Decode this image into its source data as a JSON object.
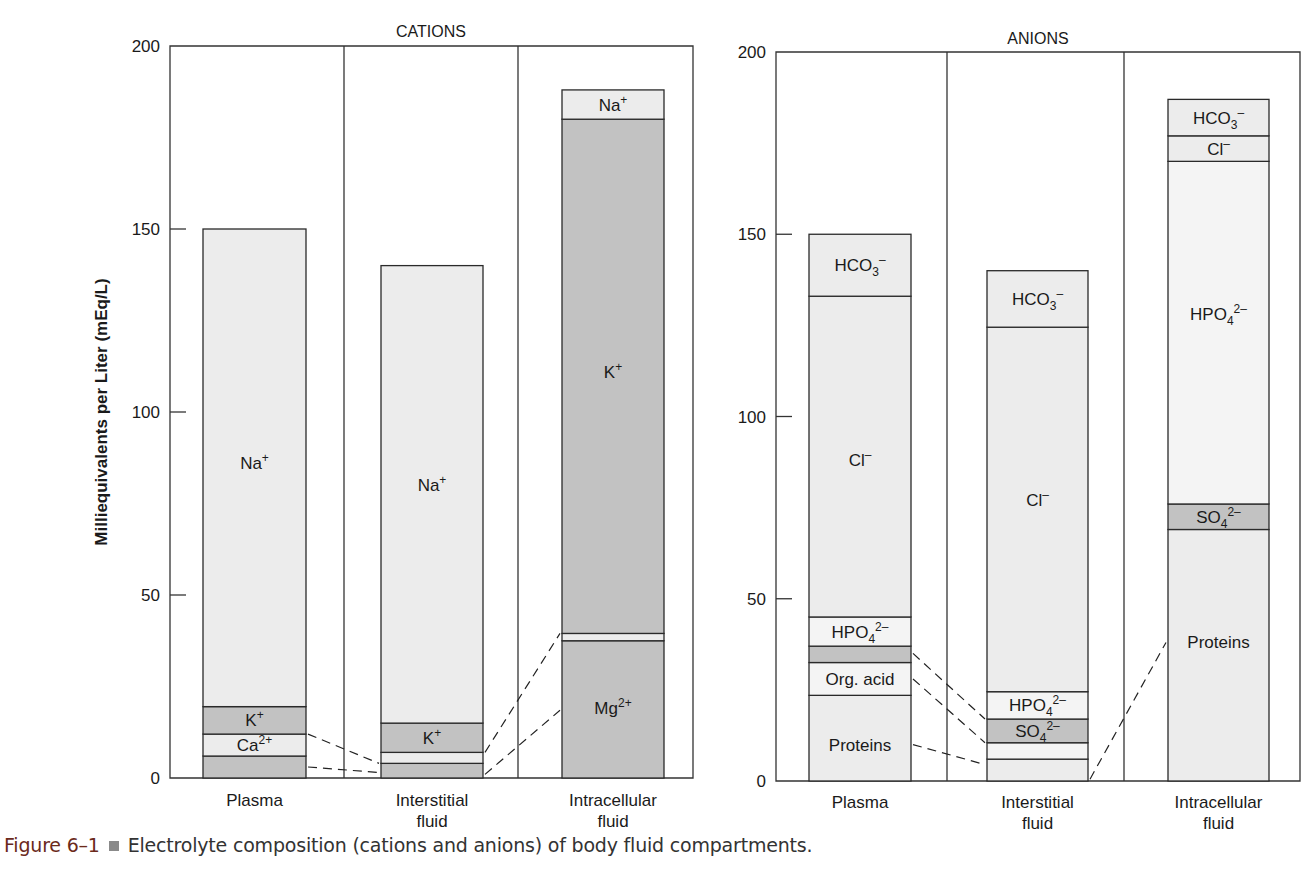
{
  "figure": {
    "caption_number": "Figure 6–1",
    "caption_text": "Electrolyte composition (cations and anions) of body fluid compartments.",
    "caption_number_color": "#6b2a1c"
  },
  "colors": {
    "light": "#ececec",
    "medium": "#d3d3d3",
    "dark": "#c2c2c2",
    "pale": "#f4f4f4",
    "frame": "#333333"
  },
  "chart_data": [
    {
      "type": "bar",
      "stacked": true,
      "title": "CATIONS",
      "xlabel": "",
      "ylabel": "Milliequivalents per Liter (mEq/L)",
      "ylim": [
        0,
        200
      ],
      "yticks": [
        0,
        50,
        100,
        150,
        200
      ],
      "categories": [
        "Plasma",
        "Interstitial fluid",
        "Intracellular fluid"
      ],
      "category_labels": [
        [
          "Plasma"
        ],
        [
          "Interstitial",
          "fluid"
        ],
        [
          "Intracellular",
          "fluid"
        ]
      ],
      "series": [
        {
          "name": "Mg2+",
          "values": [
            6,
            4,
            37.5
          ]
        },
        {
          "name": "Ca2+",
          "values": [
            6,
            3,
            2
          ]
        },
        {
          "name": "K+",
          "values": [
            7.5,
            8,
            140.5
          ]
        },
        {
          "name": "Na+",
          "values": [
            130.5,
            125,
            8
          ]
        }
      ],
      "totals": [
        150,
        140,
        188
      ],
      "stacks": [
        [
          {
            "from": 0,
            "to": 6,
            "shade": "dark",
            "label": ""
          },
          {
            "from": 6,
            "to": 12,
            "shade": "light",
            "label": "Ca",
            "sup": "2+"
          },
          {
            "from": 12,
            "to": 19.5,
            "shade": "dark",
            "label": "K",
            "sup": "+"
          },
          {
            "from": 19.5,
            "to": 150,
            "shade": "light",
            "label": "Na",
            "sup": "+",
            "label_at": 86
          }
        ],
        [
          {
            "from": 0,
            "to": 4,
            "shade": "dark",
            "label": ""
          },
          {
            "from": 4,
            "to": 7,
            "shade": "light",
            "label": ""
          },
          {
            "from": 7,
            "to": 15,
            "shade": "dark",
            "label": "K",
            "sup": "+"
          },
          {
            "from": 15,
            "to": 140,
            "shade": "light",
            "label": "Na",
            "sup": "+",
            "label_at": 80
          }
        ],
        [
          {
            "from": 0,
            "to": 37.5,
            "shade": "dark",
            "label": "Mg",
            "sup": "2+",
            "label_at": 19
          },
          {
            "from": 37.5,
            "to": 39.5,
            "shade": "light",
            "label": ""
          },
          {
            "from": 39.5,
            "to": 180,
            "shade": "dark",
            "label": "K",
            "sup": "+",
            "label_at": 111
          },
          {
            "from": 180,
            "to": 188,
            "shade": "light",
            "label": "Na",
            "sup": "+"
          }
        ]
      ],
      "connectors": [
        [
          [
            0,
            12.0,
            1,
            4.0
          ],
          [
            0,
            3.0,
            1,
            1.5
          ]
        ],
        [
          [
            1,
            7.0,
            2,
            39.5
          ],
          [
            1,
            1.0,
            2,
            18.5
          ]
        ]
      ]
    },
    {
      "type": "bar",
      "stacked": true,
      "title": "ANIONS",
      "xlabel": "",
      "ylabel": "",
      "ylim": [
        0,
        200
      ],
      "yticks": [
        0,
        50,
        100,
        150,
        200
      ],
      "categories": [
        "Plasma",
        "Interstitial fluid",
        "Intracellular fluid"
      ],
      "category_labels": [
        [
          "Plasma"
        ],
        [
          "Interstitial",
          "fluid"
        ],
        [
          "Intracellular",
          "fluid"
        ]
      ],
      "series": [
        {
          "name": "Proteins",
          "values": [
            23.5,
            6,
            69
          ]
        },
        {
          "name": "Org. acid",
          "values": [
            9,
            4.5,
            0
          ]
        },
        {
          "name": "SO4 2-",
          "values": [
            4.5,
            6.5,
            7
          ]
        },
        {
          "name": "HPO4 2-",
          "values": [
            8,
            7.5,
            94
          ]
        },
        {
          "name": "Cl-",
          "values": [
            88,
            100,
            7
          ]
        },
        {
          "name": "HCO3-",
          "values": [
            17,
            15.5,
            10
          ]
        }
      ],
      "totals": [
        150,
        140,
        187
      ],
      "stacks": [
        [
          {
            "from": 0,
            "to": 23.5,
            "shade": "light",
            "label": "Proteins",
            "label_at": 10
          },
          {
            "from": 23.5,
            "to": 32.5,
            "shade": "pale",
            "label": "Org. acid"
          },
          {
            "from": 32.5,
            "to": 37,
            "shade": "dark",
            "label": ""
          },
          {
            "from": 37,
            "to": 45,
            "shade": "pale",
            "label": "HPO",
            "sub": "4",
            "sup": "2–"
          },
          {
            "from": 45,
            "to": 133,
            "shade": "light",
            "label": "Cl",
            "sup": "–",
            "label_at": 88
          },
          {
            "from": 133,
            "to": 150,
            "shade": "light",
            "label": "HCO",
            "sub": "3",
            "sup": "–"
          }
        ],
        [
          {
            "from": 0,
            "to": 6,
            "shade": "light",
            "label": ""
          },
          {
            "from": 6,
            "to": 10.5,
            "shade": "pale",
            "label": ""
          },
          {
            "from": 10.5,
            "to": 17,
            "shade": "dark",
            "label": "SO",
            "sub": "4",
            "sup": "2–"
          },
          {
            "from": 17,
            "to": 24.5,
            "shade": "pale",
            "label": "HPO",
            "sub": "4",
            "sup": "2–"
          },
          {
            "from": 24.5,
            "to": 124.5,
            "shade": "light",
            "label": "Cl",
            "sup": "–",
            "label_at": 77
          },
          {
            "from": 124.5,
            "to": 140,
            "shade": "light",
            "label": "HCO",
            "sub": "3",
            "sup": "–"
          }
        ],
        [
          {
            "from": 0,
            "to": 69,
            "shade": "light",
            "label": "Proteins",
            "label_at": 38
          },
          {
            "from": 69,
            "to": 76,
            "shade": "dark",
            "label": "SO",
            "sub": "4",
            "sup": "2–"
          },
          {
            "from": 76,
            "to": 170,
            "shade": "pale",
            "label": "HPO",
            "sub": "4",
            "sup": "2–",
            "label_at": 128
          },
          {
            "from": 170,
            "to": 177,
            "shade": "light",
            "label": "Cl",
            "sup": "–"
          },
          {
            "from": 177,
            "to": 187,
            "shade": "light",
            "label": "HCO",
            "sub": "3",
            "sup": "–"
          }
        ]
      ],
      "connectors": [
        [
          [
            0,
            35.0,
            1,
            17.0
          ],
          [
            0,
            28.0,
            1,
            10.5
          ],
          [
            0,
            10.0,
            1,
            4.5
          ]
        ],
        [
          [
            1,
            0.5,
            2,
            38.0
          ]
        ]
      ]
    }
  ]
}
